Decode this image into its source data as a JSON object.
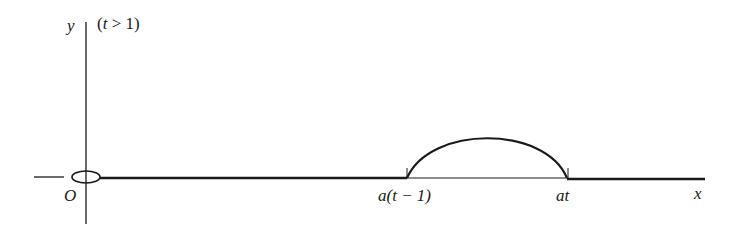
{
  "diagram": {
    "y_axis_label": "y",
    "condition": "(t > 1)",
    "origin_label": "O",
    "x_axis_label": "x",
    "point_left_label": "a(t − 1)",
    "point_right_label": "at"
  }
}
